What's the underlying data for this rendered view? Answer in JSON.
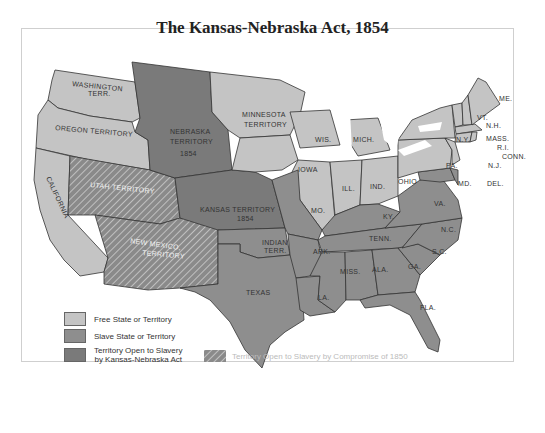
{
  "map": {
    "title": "The Kansas-Nebraska Act, 1854",
    "colors": {
      "free": "#c4c4c4",
      "slave": "#8e8e8e",
      "kansas_nebraska": "#7a7a7a",
      "compromise_1850_hatch": "#8a8a8a",
      "water": "#ffffff",
      "border": "#333333"
    },
    "regions": {
      "washington": "WASHINGTON",
      "washington2": "TERR.",
      "oregon": "OREGON TERRITORY",
      "california": "CALIFORNIA",
      "utah": "UTAH TERRITORY",
      "new_mexico": "NEW MEXICO,",
      "new_mexico2": "TERRITORY",
      "nebraska": "NEBRASKA",
      "nebraska2": "TERRITORY",
      "nebraska3": "1854",
      "kansas": "KANSAS TERRITORY",
      "kansas2": "1854",
      "minnesota": "MINNESOTA",
      "minnesota2": "TERRITORY",
      "indian": "INDIAN",
      "indian2": "TERR.",
      "texas": "TEXAS",
      "iowa": "IOWA",
      "wis": "WIS.",
      "mich": "MICH.",
      "ill": "ILL.",
      "ind": "IND.",
      "ohio": "OHIO",
      "mo": "MO.",
      "ky": "KY.",
      "ark": "ARK.",
      "tenn": "TENN.",
      "la": "LA.",
      "miss": "MISS.",
      "ala": "ALA.",
      "ga": "GA.",
      "fla": "FLA.",
      "sc": "S.C.",
      "nc": "N.C.",
      "va": "VA.",
      "md": "MD.",
      "del": "DEL.",
      "nj": "N.J.",
      "pa": "PA.",
      "ny": "N.Y.",
      "vt": "VT.",
      "nh": "N.H.",
      "mass": "MASS.",
      "ri": "R.I.",
      "conn": "CONN.",
      "me": "ME."
    }
  },
  "legend": {
    "items": [
      {
        "label": "Free State or Territory",
        "color": "#c4c4c4"
      },
      {
        "label": "Slave State or Territory",
        "color": "#8e8e8e"
      },
      {
        "label": "Territory Open to Slavery",
        "label2": "by Kansas-Nebraska Act",
        "color": "#7a7a7a"
      },
      {
        "label": "Territory Open to Slavery by Compromise of 1850",
        "pattern": "hatched"
      }
    ]
  }
}
